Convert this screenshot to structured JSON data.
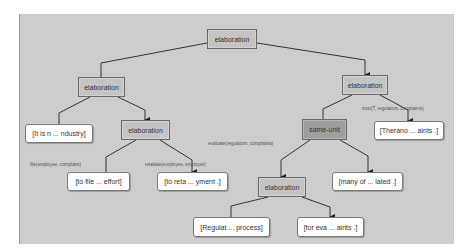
{
  "diagram": {
    "type": "RST discourse tree",
    "nodes": {
      "root": "elaboration",
      "left": "elaboration",
      "right": "elaboration",
      "leaf_industry": "[It is n ... ndustry]",
      "left_inner": "elaboration",
      "leaf_therano": "[Therano ... aints .]",
      "same_unit": "same-unit",
      "leaf_to_file": "[to file ... effort]",
      "leaf_to_reta": "[to reta ... yment .]",
      "bottom_elab": "elaboration",
      "leaf_many_of": "[many of ... iated .]",
      "leaf_regulat": "[Regulat ... process]",
      "leaf_for_eva": "[for eva ... aints .]"
    },
    "edge_labels": {
      "file": "file(employee, complaint)",
      "retaliate": "retaliate(employee, employer)",
      "evaluate": "evaluate(regulators, complaints)",
      "trust": "trust(T, regulators, complaints)"
    },
    "colors": {
      "panel": "#cdcdcd",
      "relation_node": "#c4c4c4",
      "same_unit_node": "#9e9e9e",
      "leaf_node": "#ffffff",
      "edge": "#333333"
    }
  }
}
